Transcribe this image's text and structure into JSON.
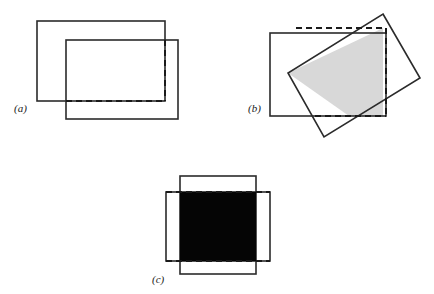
{
  "figure": {
    "caption_labels": [
      "(a)",
      "(b)",
      "(c)"
    ],
    "background_color": "#ffffff",
    "stroke_color": "#2b2b2b",
    "dashed_color": "#1a1a1a",
    "shaded_fill": "#d8d8d8",
    "solid_fill": "#050505",
    "stroke_width": 1.6,
    "dash_width": 2.0,
    "dash_pattern": "6,4"
  },
  "panels": [
    {
      "id": "panel-a",
      "label": "(a)",
      "label_x": 14,
      "label_y": 112,
      "description": "two overlapping axis-aligned rectangles with dashed intersection boundary",
      "rect_primary": {
        "x": 37,
        "y": 21,
        "width": 128,
        "height": 80
      },
      "rect_secondary": {
        "x": 66,
        "y": 40,
        "width": 112,
        "height": 79
      },
      "intersection": {
        "x": 66,
        "y": 40,
        "width": 99,
        "height": 61
      },
      "dashed_edges": [
        "right",
        "bottom"
      ],
      "fill": "none"
    },
    {
      "id": "panel-b",
      "label": "(b)",
      "label_x": 248,
      "label_y": 112,
      "description": "axis-aligned rectangle overlapping a rotated rectangle, intersection shaded gray with dashed boundary",
      "rect_primary": {
        "x": 270,
        "y": 33,
        "width": 116,
        "height": 83
      },
      "rect_rotated_points": "383,14 420,78 324,137 288,73",
      "intersection_polygon": "288,73 383,28 383,116 349,116",
      "dashed_edges": [
        "top",
        "right",
        "bottom"
      ],
      "fill": "#d8d8d8"
    },
    {
      "id": "panel-c",
      "label": "(c)",
      "label_x": 152,
      "label_y": 283,
      "description": "tall vertical rectangle crossing a wide horizontal rectangle, intersection filled solid black with dashed horizontal boundary",
      "rect_primary": {
        "x": 180,
        "y": 176,
        "width": 76,
        "height": 98
      },
      "rect_secondary": {
        "x": 166,
        "y": 192,
        "width": 104,
        "height": 69
      },
      "intersection": {
        "x": 180,
        "y": 192,
        "width": 76,
        "height": 69
      },
      "dashed_edges": [
        "top",
        "bottom"
      ],
      "fill": "#050505"
    }
  ]
}
